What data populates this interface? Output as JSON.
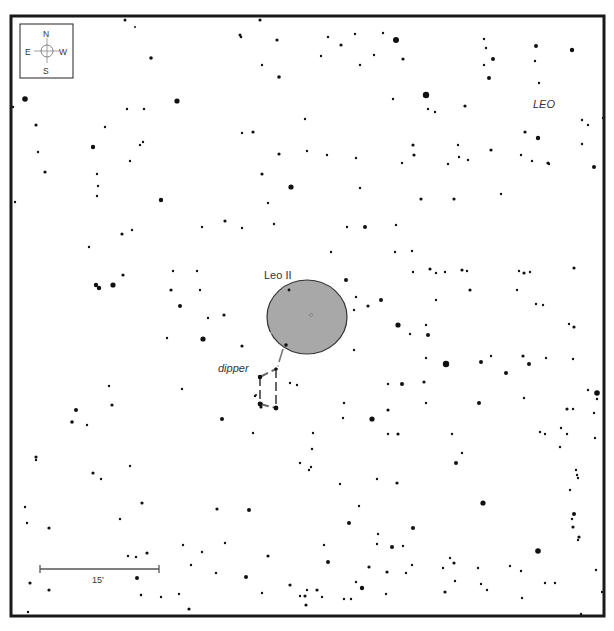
{
  "chart": {
    "object_name": "Leo II",
    "constellation": "LEO",
    "asterism_label": "dipper",
    "scale_label": "15'",
    "compass": {
      "north": "N",
      "south": "S",
      "east": "E",
      "west": "W"
    },
    "colors": {
      "frame": "#1a1a1a",
      "star": "#111111",
      "galaxy_fill": "#a8a8a8",
      "galaxy_stroke": "#333333",
      "asterism_line": "#666666",
      "label": "#333333"
    }
  },
  "chart_data": {
    "type": "scatter",
    "frame": {
      "x": 10,
      "y": 15,
      "width": 595,
      "height": 602
    },
    "galaxy": {
      "name": "Leo II",
      "cx": 307,
      "cy": 317,
      "rx": 40,
      "ry": 37
    },
    "galaxy_pointer": [
      [
        286,
        345
      ],
      [
        278,
        369
      ]
    ],
    "asterism": {
      "name": "dipper",
      "lines": [
        [
          [
            260,
            377
          ],
          [
            276,
            369
          ]
        ],
        [
          [
            276,
            369
          ],
          [
            276,
            408
          ]
        ],
        [
          [
            260,
            377
          ],
          [
            260,
            404
          ]
        ],
        [
          [
            260,
            404
          ],
          [
            276,
            408
          ]
        ]
      ]
    },
    "scale_bar": {
      "x1": 40,
      "x2": 159,
      "y": 569,
      "label": "15'"
    },
    "stars": [
      [
        125,
        20,
        1.5
      ],
      [
        135,
        27,
        1
      ],
      [
        151,
        58,
        1.8
      ],
      [
        240,
        35,
        1.5
      ],
      [
        241,
        37,
        1.3
      ],
      [
        260,
        20,
        1.6
      ],
      [
        277,
        40,
        1.6
      ],
      [
        262,
        65,
        1.2
      ],
      [
        279,
        77,
        1.8
      ],
      [
        25,
        99,
        2.8
      ],
      [
        177,
        101,
        2.6
      ],
      [
        127,
        109,
        1.2
      ],
      [
        144,
        109,
        1.2
      ],
      [
        13,
        107,
        1.2
      ],
      [
        36,
        125,
        1.6
      ],
      [
        105,
        127,
        1.2
      ],
      [
        93,
        147,
        2.2
      ],
      [
        140,
        145,
        1.2
      ],
      [
        143,
        142,
        1.2
      ],
      [
        38,
        152,
        1.2
      ],
      [
        253,
        132,
        1.6
      ],
      [
        242,
        133,
        1.2
      ],
      [
        279,
        154,
        1.6
      ],
      [
        305,
        119,
        1.2
      ],
      [
        328,
        37,
        1.2
      ],
      [
        355,
        34,
        1.2
      ],
      [
        341,
        45,
        1.6
      ],
      [
        383,
        33,
        1.2
      ],
      [
        396,
        40,
        3
      ],
      [
        374,
        55,
        1.2
      ],
      [
        321,
        56,
        1.2
      ],
      [
        360,
        65,
        1.2
      ],
      [
        403,
        59,
        1.6
      ],
      [
        426,
        95,
        3.2
      ],
      [
        393,
        99,
        1.2
      ],
      [
        428,
        109,
        1.2
      ],
      [
        435,
        112,
        1.2
      ],
      [
        465,
        106,
        1.6
      ],
      [
        484,
        39,
        1.2
      ],
      [
        486,
        48,
        1.2
      ],
      [
        493,
        59,
        2
      ],
      [
        484,
        65,
        1.2
      ],
      [
        489,
        78,
        2
      ],
      [
        536,
        46,
        2
      ],
      [
        572,
        50,
        2.2
      ],
      [
        535,
        61,
        1.2
      ],
      [
        539,
        83,
        1.2
      ],
      [
        603,
        118,
        1.2
      ],
      [
        582,
        120,
        1.2
      ],
      [
        588,
        125,
        1.2
      ],
      [
        582,
        144,
        1.2
      ],
      [
        525,
        132,
        1.6
      ],
      [
        538,
        138,
        2.2
      ],
      [
        413,
        145,
        1.6
      ],
      [
        458,
        145,
        1.2
      ],
      [
        459,
        157,
        1.2
      ],
      [
        491,
        150,
        1.6
      ],
      [
        521,
        155,
        1.2
      ],
      [
        548,
        163,
        1.6
      ],
      [
        15,
        202,
        1.2
      ],
      [
        45,
        172,
        1.6
      ],
      [
        97,
        174,
        1.2
      ],
      [
        98,
        186,
        1.2
      ],
      [
        130,
        161,
        1.2
      ],
      [
        161,
        200,
        2.2
      ],
      [
        97,
        196,
        1.2
      ],
      [
        262,
        174,
        1.6
      ],
      [
        291,
        187,
        2.6
      ],
      [
        268,
        203,
        1.2
      ],
      [
        274,
        224,
        1.2
      ],
      [
        225,
        221,
        1.6
      ],
      [
        242,
        228,
        1.2
      ],
      [
        202,
        227,
        1.2
      ],
      [
        307,
        151,
        1.2
      ],
      [
        327,
        155,
        1.2
      ],
      [
        356,
        158,
        1.2
      ],
      [
        402,
        163,
        1.2
      ],
      [
        414,
        155,
        1.6
      ],
      [
        468,
        160,
        1.2
      ],
      [
        448,
        164,
        1.2
      ],
      [
        532,
        161,
        1.2
      ],
      [
        549,
        164,
        1.2
      ],
      [
        594,
        167,
        2
      ],
      [
        360,
        188,
        1.2
      ],
      [
        421,
        199,
        1.6
      ],
      [
        454,
        199,
        1.6
      ],
      [
        501,
        194,
        1.2
      ],
      [
        89,
        247,
        1.2
      ],
      [
        122,
        234,
        1.6
      ],
      [
        132,
        230,
        1.2
      ],
      [
        365,
        227,
        2
      ],
      [
        347,
        227,
        1.2
      ],
      [
        396,
        225,
        1.2
      ],
      [
        395,
        252,
        1.2
      ],
      [
        412,
        251,
        1.2
      ],
      [
        331,
        252,
        1.2
      ],
      [
        413,
        272,
        1.2
      ],
      [
        430,
        269,
        1.6
      ],
      [
        436,
        273,
        1.2
      ],
      [
        445,
        272,
        1.2
      ],
      [
        462,
        270,
        1.6
      ],
      [
        467,
        271,
        1.2
      ],
      [
        519,
        271,
        1.2
      ],
      [
        524,
        273,
        1.6
      ],
      [
        530,
        272,
        1.2
      ],
      [
        574,
        268,
        1.6
      ],
      [
        346,
        280,
        2
      ],
      [
        356,
        297,
        1.2
      ],
      [
        381,
        300,
        2
      ],
      [
        436,
        300,
        1.2
      ],
      [
        470,
        290,
        1.6
      ],
      [
        517,
        290,
        1.2
      ],
      [
        96,
        285,
        2.2
      ],
      [
        99,
        288,
        2.2
      ],
      [
        113,
        285,
        2.6
      ],
      [
        123,
        275,
        1.6
      ],
      [
        173,
        271,
        1.2
      ],
      [
        197,
        271,
        1.2
      ],
      [
        171,
        290,
        1.6
      ],
      [
        200,
        290,
        1.2
      ],
      [
        180,
        306,
        2
      ],
      [
        368,
        306,
        1.6
      ],
      [
        354,
        310,
        1.2
      ],
      [
        354,
        350,
        1.2
      ],
      [
        242,
        346,
        1.6
      ],
      [
        203,
        339,
        2.6
      ],
      [
        167,
        338,
        1.2
      ],
      [
        208,
        318,
        1.2
      ],
      [
        224,
        315,
        1.6
      ],
      [
        398,
        325,
        2.6
      ],
      [
        426,
        325,
        1.2
      ],
      [
        410,
        334,
        1.2
      ],
      [
        428,
        335,
        2
      ],
      [
        426,
        358,
        1.2
      ],
      [
        543,
        305,
        1.2
      ],
      [
        574,
        327,
        1.6
      ],
      [
        536,
        304,
        1.2
      ],
      [
        569,
        324,
        1.2
      ],
      [
        546,
        358,
        1.2
      ],
      [
        446,
        364,
        3.2
      ],
      [
        481,
        362,
        2
      ],
      [
        506,
        373,
        2
      ],
      [
        523,
        356,
        1.6
      ],
      [
        529,
        364,
        2
      ],
      [
        573,
        359,
        1.2
      ],
      [
        491,
        356,
        1.2
      ],
      [
        588,
        390,
        1.2
      ],
      [
        297,
        385,
        1.2
      ],
      [
        388,
        384,
        1.2
      ],
      [
        402,
        384,
        2
      ],
      [
        424,
        382,
        1.6
      ],
      [
        524,
        398,
        1.2
      ],
      [
        597,
        393,
        2.8
      ],
      [
        597,
        399,
        1.2
      ],
      [
        109,
        386,
        1.2
      ],
      [
        112,
        405,
        1.6
      ],
      [
        182,
        389,
        1.2
      ],
      [
        222,
        419,
        2
      ],
      [
        255,
        396,
        1.2
      ],
      [
        261,
        404,
        2
      ],
      [
        276,
        408,
        2
      ],
      [
        260,
        377,
        2
      ],
      [
        276,
        369,
        1.6
      ],
      [
        290,
        383,
        1.2
      ],
      [
        344,
        403,
        1.2
      ],
      [
        343,
        418,
        1.2
      ],
      [
        372,
        419,
        2.6
      ],
      [
        388,
        410,
        1.6
      ],
      [
        426,
        403,
        1.2
      ],
      [
        479,
        403,
        2
      ],
      [
        567,
        409,
        1.6
      ],
      [
        573,
        409,
        1.2
      ],
      [
        594,
        413,
        1.2
      ],
      [
        76,
        410,
        2
      ],
      [
        72,
        422,
        1.8
      ],
      [
        87,
        425,
        1.2
      ],
      [
        253,
        433,
        1.2
      ],
      [
        313,
        433,
        1.2
      ],
      [
        312,
        449,
        1.2
      ],
      [
        388,
        434,
        1.2
      ],
      [
        398,
        434,
        1.6
      ],
      [
        452,
        434,
        1.2
      ],
      [
        456,
        463,
        2
      ],
      [
        462,
        453,
        1.2
      ],
      [
        540,
        432,
        1.2
      ],
      [
        545,
        434,
        1.2
      ],
      [
        561,
        428,
        1.2
      ],
      [
        567,
        434,
        1.2
      ],
      [
        560,
        447,
        1.2
      ],
      [
        595,
        438,
        1.2
      ],
      [
        36,
        457,
        1.6
      ],
      [
        36,
        460,
        1.2
      ],
      [
        93,
        473,
        1.6
      ],
      [
        101,
        479,
        1.2
      ],
      [
        130,
        466,
        1.2
      ],
      [
        142,
        503,
        1.6
      ],
      [
        217,
        509,
        1.6
      ],
      [
        249,
        510,
        2
      ],
      [
        311,
        467,
        1.2
      ],
      [
        340,
        484,
        1.2
      ],
      [
        377,
        479,
        1.2
      ],
      [
        397,
        483,
        1.6
      ],
      [
        359,
        506,
        1.2
      ],
      [
        413,
        528,
        2
      ],
      [
        483,
        503,
        2.6
      ],
      [
        577,
        475,
        1.2
      ],
      [
        578,
        478,
        1.2
      ],
      [
        570,
        490,
        1.2
      ],
      [
        25,
        507,
        1.2
      ],
      [
        27,
        523,
        1.2
      ],
      [
        49,
        528,
        1.6
      ],
      [
        120,
        519,
        1.2
      ],
      [
        128,
        556,
        1.2
      ],
      [
        136,
        557,
        1.2
      ],
      [
        147,
        553,
        1.6
      ],
      [
        202,
        552,
        1.2
      ],
      [
        191,
        565,
        1.2
      ],
      [
        183,
        545,
        1.2
      ],
      [
        225,
        543,
        1.2
      ],
      [
        216,
        573,
        1.2
      ],
      [
        246,
        577,
        2
      ],
      [
        141,
        595,
        1.2
      ],
      [
        349,
        523,
        2
      ],
      [
        328,
        562,
        2
      ],
      [
        324,
        545,
        1.2
      ],
      [
        378,
        534,
        1.2
      ],
      [
        377,
        544,
        1.2
      ],
      [
        392,
        547,
        2
      ],
      [
        403,
        546,
        1.2
      ],
      [
        369,
        567,
        1.6
      ],
      [
        406,
        573,
        1.2
      ],
      [
        356,
        582,
        1.2
      ],
      [
        387,
        572,
        1.6
      ],
      [
        412,
        565,
        1.2
      ],
      [
        443,
        568,
        1.2
      ],
      [
        454,
        563,
        1.6
      ],
      [
        478,
        568,
        1.2
      ],
      [
        344,
        599,
        1.2
      ],
      [
        351,
        599,
        1.2
      ],
      [
        450,
        558,
        1.2
      ],
      [
        538,
        551,
        2.8
      ],
      [
        545,
        583,
        1.2
      ],
      [
        510,
        566,
        1.2
      ],
      [
        521,
        571,
        1.2
      ],
      [
        555,
        583,
        1.2
      ],
      [
        573,
        527,
        1.6
      ],
      [
        578,
        540,
        1.2
      ],
      [
        572,
        519,
        1.2
      ],
      [
        576,
        470,
        1.2
      ],
      [
        574,
        514,
        2
      ],
      [
        579,
        537,
        1.6
      ],
      [
        596,
        570,
        1.2
      ],
      [
        30,
        583,
        1.6
      ],
      [
        49,
        590,
        1.6
      ],
      [
        137,
        578,
        2
      ],
      [
        141,
        595,
        1.2
      ],
      [
        28,
        612,
        1.2
      ],
      [
        161,
        597,
        1.2
      ],
      [
        179,
        594,
        1.2
      ],
      [
        189,
        609,
        1.6
      ],
      [
        268,
        556,
        1.6
      ],
      [
        290,
        585,
        1.6
      ],
      [
        262,
        593,
        1.2
      ],
      [
        307,
        590,
        1.2
      ],
      [
        317,
        590,
        1.6
      ],
      [
        305,
        596,
        1.6
      ],
      [
        306,
        605,
        1.6
      ],
      [
        300,
        596,
        1.2
      ],
      [
        322,
        597,
        1.2
      ],
      [
        445,
        592,
        1.6
      ],
      [
        455,
        581,
        1.2
      ],
      [
        481,
        584,
        1.2
      ],
      [
        487,
        590,
        1.2
      ],
      [
        522,
        598,
        1.2
      ],
      [
        602,
        592,
        1.2
      ],
      [
        581,
        614,
        1.2
      ],
      [
        362,
        588,
        2.2
      ],
      [
        386,
        594,
        1.2
      ],
      [
        300,
        463,
        1.2
      ],
      [
        309,
        470,
        1.2
      ]
    ]
  }
}
